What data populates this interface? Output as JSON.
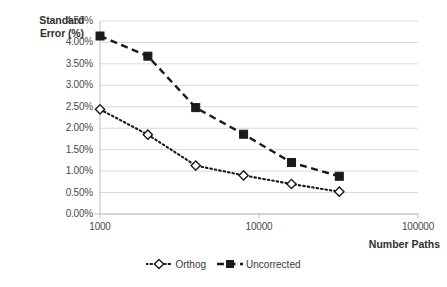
{
  "chart_data": {
    "type": "line",
    "title": "",
    "xlabel": "Number Paths",
    "ylabel": "Standard Error (%)",
    "xscale": "log",
    "xlim": [
      1000,
      100000
    ],
    "ylim": [
      0,
      4.5
    ],
    "grid": "horizontal",
    "legend_position": "bottom",
    "x": [
      1000,
      2000,
      4000,
      8000,
      16000,
      32000
    ],
    "xtick_labels": [
      "1000",
      "10000",
      "100000"
    ],
    "xtick_values": [
      1000,
      10000,
      100000
    ],
    "ytick_labels": [
      "0.00%",
      "0.50%",
      "1.00%",
      "1.50%",
      "2.00%",
      "2.50%",
      "3.00%",
      "3.50%",
      "4.00%",
      "4.50%"
    ],
    "ytick_values": [
      0,
      0.5,
      1.0,
      1.5,
      2.0,
      2.5,
      3.0,
      3.5,
      4.0,
      4.5
    ],
    "series": [
      {
        "name": "Orthog",
        "marker": "open-diamond",
        "linestyle": "dotted",
        "color": "#1a1a1a",
        "values": [
          2.44,
          1.85,
          1.13,
          0.9,
          0.7,
          0.52
        ]
      },
      {
        "name": "Uncorrected",
        "marker": "filled-square",
        "linestyle": "dashed",
        "color": "#1a1a1a",
        "values": [
          4.15,
          3.68,
          2.48,
          1.86,
          1.2,
          0.88
        ]
      }
    ]
  },
  "axis": {
    "y_title_line1": "Standard",
    "y_title_line2": "Error (%)",
    "x_title": "Number Paths"
  },
  "legend": {
    "items": [
      {
        "label": "Orthog"
      },
      {
        "label": "Uncorrected"
      }
    ]
  },
  "colors": {
    "series_line": "#1a1a1a",
    "gridline": "#d9d9d9",
    "axis_line": "#bfbfbf",
    "text": "#3a3a3a",
    "background": "#ffffff"
  }
}
